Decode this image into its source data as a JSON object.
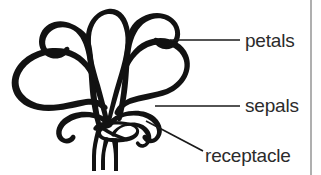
{
  "figure": {
    "kind": "line-drawing-diagram",
    "background_color": "#ffffff",
    "ink_color": "#121212",
    "text_color": "#2b2b2b",
    "rule_color": "#8d8d8d"
  },
  "labels": [
    {
      "id": "petals",
      "text": "petals",
      "x": 245,
      "y": 47,
      "leader": {
        "type": "straight",
        "x1": 170,
        "y1": 40,
        "x2": 240,
        "y2": 40
      }
    },
    {
      "id": "sepals",
      "text": "sepals",
      "x": 245,
      "y": 112,
      "leader": {
        "type": "straight",
        "x1": 155,
        "y1": 106,
        "x2": 240,
        "y2": 106
      }
    },
    {
      "id": "receptacle",
      "text": "receptacle",
      "x": 205,
      "y": 162,
      "leader": {
        "type": "diagonal",
        "x1": 146,
        "y1": 121,
        "x2": 203,
        "y2": 151
      }
    }
  ],
  "divider": {
    "id": "right-column-rule",
    "x": 311,
    "y1": 0,
    "y2": 175
  }
}
